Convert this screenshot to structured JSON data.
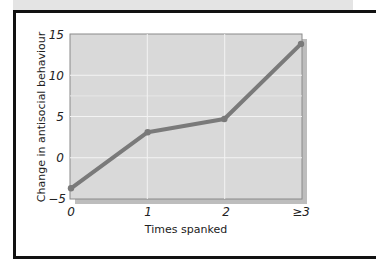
{
  "chart_data": {
    "type": "line",
    "title": "",
    "xlabel": "Times spanked",
    "ylabel": "Change in antisocial behaviour",
    "categories": [
      "0",
      "1",
      "2",
      "≥3"
    ],
    "series": [
      {
        "name": "Change in antisocial behaviour",
        "values": [
          -3.7,
          3.1,
          4.7,
          13.8
        ]
      }
    ],
    "ylim": [
      -5,
      15
    ],
    "yticks": [
      "15",
      "10",
      "5",
      "0",
      "-5"
    ],
    "grid": true,
    "legend": "none",
    "colors": {
      "plot_bg": "#d9d9d9",
      "line": "#7a7a7a",
      "grid": "#f4f4f4",
      "shadow": "#bcbcbc"
    }
  },
  "labels": {
    "x_title": "Times spanked",
    "y_title": "Change in antisocial behaviour",
    "x_ticks": [
      "0",
      "1",
      "2",
      "≥3"
    ],
    "y_ticks": [
      "15",
      "10",
      "5",
      "0",
      "−5"
    ]
  }
}
